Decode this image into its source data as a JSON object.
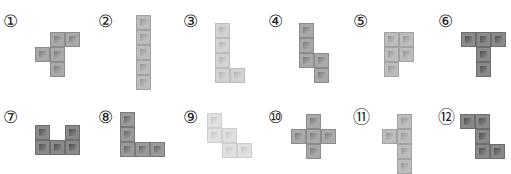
{
  "figures": [
    {
      "label": "①",
      "tone": "medium",
      "cells": [
        [
          1,
          0
        ],
        [
          2,
          0
        ],
        [
          0,
          1
        ],
        [
          1,
          1
        ],
        [
          1,
          2
        ]
      ]
    },
    {
      "label": "②",
      "tone": "mediumlight",
      "cells": [
        [
          0,
          0
        ],
        [
          0,
          1
        ],
        [
          0,
          2
        ],
        [
          0,
          3
        ],
        [
          0,
          4
        ]
      ]
    },
    {
      "label": "③",
      "tone": "light",
      "cells": [
        [
          0,
          0
        ],
        [
          0,
          1
        ],
        [
          0,
          2
        ],
        [
          0,
          3
        ],
        [
          1,
          3
        ]
      ]
    },
    {
      "label": "④",
      "tone": "medium",
      "cells": [
        [
          0,
          0
        ],
        [
          0,
          1
        ],
        [
          0,
          2
        ],
        [
          1,
          2
        ],
        [
          1,
          3
        ]
      ]
    },
    {
      "label": "⑤",
      "tone": "mediumlight",
      "cells": [
        [
          0,
          0
        ],
        [
          1,
          0
        ],
        [
          0,
          1
        ],
        [
          1,
          1
        ],
        [
          0,
          2
        ]
      ]
    },
    {
      "label": "⑥",
      "tone": "dark",
      "cells": [
        [
          0,
          0
        ],
        [
          1,
          0
        ],
        [
          2,
          0
        ],
        [
          1,
          1
        ],
        [
          1,
          2
        ]
      ]
    },
    {
      "label": "⑦",
      "tone": "dark",
      "cells": [
        [
          0,
          0
        ],
        [
          2,
          0
        ],
        [
          0,
          1
        ],
        [
          1,
          1
        ],
        [
          2,
          1
        ]
      ]
    },
    {
      "label": "⑧",
      "tone": "mediumdark",
      "cells": [
        [
          0,
          0
        ],
        [
          0,
          1
        ],
        [
          0,
          2
        ],
        [
          1,
          2
        ],
        [
          2,
          2
        ]
      ]
    },
    {
      "label": "⑨",
      "tone": "verylight",
      "cells": [
        [
          0,
          0
        ],
        [
          0,
          1
        ],
        [
          1,
          1
        ],
        [
          1,
          2
        ],
        [
          2,
          2
        ]
      ]
    },
    {
      "label": "⑩",
      "tone": "medium",
      "cells": [
        [
          1,
          0
        ],
        [
          0,
          1
        ],
        [
          1,
          1
        ],
        [
          2,
          1
        ],
        [
          1,
          2
        ]
      ]
    },
    {
      "label": "⑪",
      "tone": "mediumlight",
      "cells": [
        [
          1,
          0
        ],
        [
          0,
          1
        ],
        [
          1,
          1
        ],
        [
          1,
          2
        ],
        [
          1,
          3
        ]
      ]
    },
    {
      "label": "⑫",
      "tone": "dark",
      "cells": [
        [
          0,
          0
        ],
        [
          1,
          0
        ],
        [
          1,
          1
        ],
        [
          1,
          2
        ],
        [
          2,
          2
        ]
      ]
    }
  ]
}
